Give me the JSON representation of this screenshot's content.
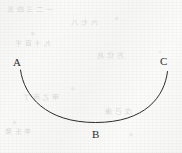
{
  "figure": {
    "kind": "geometry-arc-diagram",
    "background_color": "#f7f7f6",
    "stroke_color": "#2b2b2b",
    "stroke_width": 1,
    "width": 182,
    "height": 153
  },
  "curve": {
    "name": "concave-up-arc",
    "start_label": "A",
    "lowest_label": "B",
    "end_label": "C",
    "path": "M 20.5 70 C 24 96, 46 122.5, 95.5 122.5 C 145 122.5, 164.5 97, 167.5 71.5"
  },
  "labels": {
    "a": "A",
    "b": "B",
    "c": "C"
  },
  "bleed_through": {
    "line1": "一 二 三 四 五",
    "line2": "六 七 八",
    "line3": "九 十 百 千",
    "line4": "万 亿 兆",
    "line5": "甲 乙 丙 丁",
    "line6": "戊 己 庚",
    "line7": "辛 壬 癸"
  }
}
